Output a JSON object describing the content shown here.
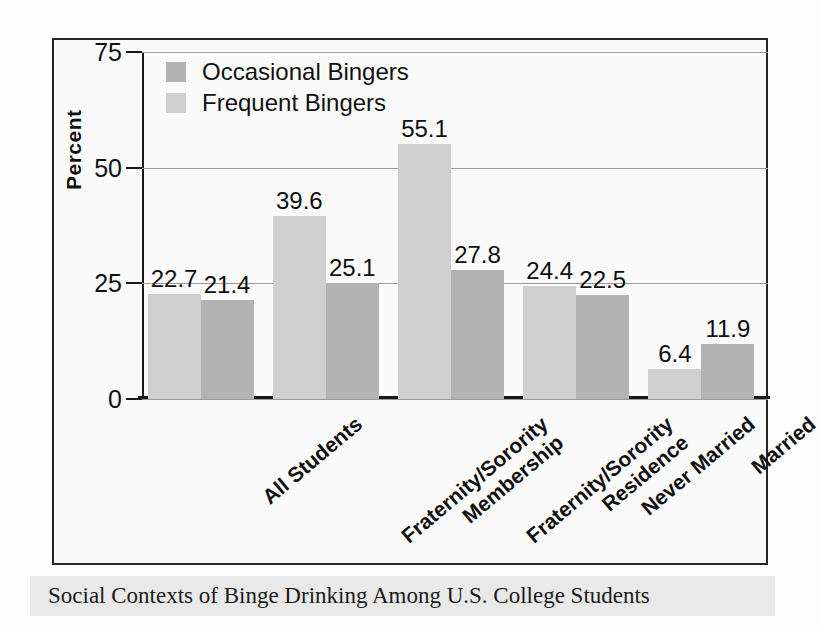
{
  "caption": {
    "text": "Social Contexts of Binge Drinking Among U.S. College Students"
  },
  "chart_data": {
    "type": "bar",
    "title": "",
    "xlabel": "",
    "ylabel": "Percent",
    "ylim": [
      0,
      75
    ],
    "yticks": [
      0,
      25,
      50,
      75
    ],
    "ytick_labels": [
      "0",
      "25",
      "50",
      "75"
    ],
    "grid": true,
    "legend_position": "top-left",
    "categories": [
      "All Students",
      "Fraternity/Sorority Membership",
      "Fraternity/Sorority Residence",
      "Never Married",
      "Married"
    ],
    "category_lines": [
      [
        "All Students"
      ],
      [
        "Fraternity/Sorority",
        "Membership"
      ],
      [
        "Fraternity/Sorority",
        "Residence"
      ],
      [
        "Never Married"
      ],
      [
        "Married"
      ]
    ],
    "series": [
      {
        "name": "Frequent Bingers",
        "color": "#cfcfcf",
        "values": [
          22.7,
          39.6,
          55.1,
          24.4,
          6.4
        ]
      },
      {
        "name": "Occasional Bingers",
        "color": "#b3b3b3",
        "values": [
          21.4,
          25.1,
          27.8,
          22.5,
          11.9
        ]
      }
    ],
    "legend": [
      {
        "label": "Occasional Bingers",
        "color": "#b3b3b3"
      },
      {
        "label": "Frequent Bingers",
        "color": "#cfcfcf"
      }
    ],
    "value_labels": [
      "22.7",
      "21.4",
      "39.6",
      "25.1",
      "55.1",
      "27.8",
      "24.4",
      "22.5",
      "6.4",
      "11.9"
    ]
  },
  "colors": {
    "axis": "#1a1a1a",
    "grid": "#9a9a9a",
    "frame": "#262626",
    "caption_bg": "#e9e9e9",
    "plot_bg": "#fafafa"
  }
}
